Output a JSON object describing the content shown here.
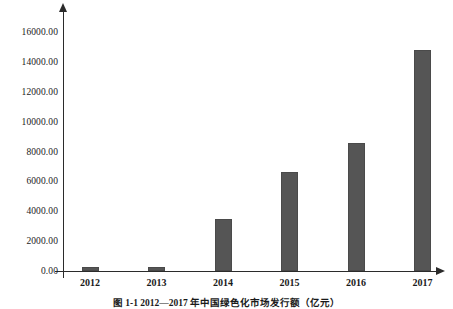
{
  "figure": {
    "caption": "图 1-1  2012—2017 年中国绿色化市场发行额（亿元）"
  },
  "chart_data": {
    "type": "bar",
    "title": "",
    "subtitle": "",
    "xlabel": "",
    "ylabel": "",
    "categories": [
      "2012",
      "2013",
      "2014",
      "2015",
      "2016",
      "2017"
    ],
    "values": [
      250,
      270,
      3500,
      6600,
      8600,
      14800
    ],
    "series": [
      {
        "name": "发行额",
        "values": [
          250,
          270,
          3500,
          6600,
          8600,
          14800
        ]
      }
    ],
    "ylim": [
      0,
      16000
    ],
    "y_ticks": [
      0,
      2000,
      4000,
      6000,
      8000,
      10000,
      12000,
      14000,
      16000
    ],
    "y_tick_labels": [
      "0.00",
      "2000.00",
      "4000.00",
      "6000.00",
      "8000.00",
      "10000.00",
      "12000.00",
      "14000.00",
      "16000.00"
    ],
    "x_tick_labels": [
      "2012",
      "2013",
      "2014",
      "2015",
      "2016",
      "2017"
    ],
    "grid": false,
    "legend": false,
    "legend_position": "none",
    "bar_color": "#555555",
    "axis_color": "#2b2b2b",
    "background_color": "#ffffff"
  }
}
